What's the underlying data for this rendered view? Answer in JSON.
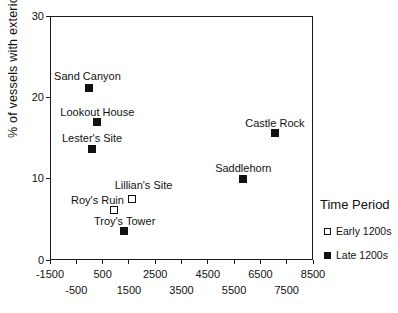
{
  "figure": {
    "background": "#ffffff",
    "marker_color": "#111111"
  },
  "chart_data": {
    "type": "scatter",
    "title": "",
    "xlabel": "",
    "ylabel": "% of vessels with exterior banded designs",
    "xlim": [
      -1500,
      8500
    ],
    "ylim": [
      0,
      30
    ],
    "grid": false,
    "x_ticks_row1": [
      -1500,
      500,
      2500,
      4500,
      6500,
      8500
    ],
    "x_ticks_row2": [
      -500,
      1500,
      3500,
      5500,
      7500
    ],
    "y_ticks": [
      0,
      10,
      20,
      30
    ],
    "legend": {
      "title": "Time Period",
      "position": "right-outside",
      "entries": [
        {
          "label": "Early 1200s",
          "marker": "open-square"
        },
        {
          "label": "Late 1200s",
          "marker": "filled-square"
        }
      ]
    },
    "series": [
      {
        "name": "Early 1200s",
        "marker": "open-square",
        "points": [
          {
            "label": "Lillian's Site",
            "x": 1600,
            "y": 7.5,
            "label_dx": 12,
            "label_dy": -14
          },
          {
            "label": "Roy's Ruin",
            "x": 950,
            "y": 6.2,
            "label_dx": -17,
            "label_dy": -10
          }
        ]
      },
      {
        "name": "Late 1200s",
        "marker": "filled-square",
        "points": [
          {
            "label": "Sand Canyon",
            "x": 0,
            "y": 21.2,
            "label_dx": -2,
            "label_dy": -12
          },
          {
            "label": "Lookout House",
            "x": 300,
            "y": 17.0,
            "label_dx": 0,
            "label_dy": -10
          },
          {
            "label": "Lester's Site",
            "x": 100,
            "y": 13.7,
            "label_dx": 0,
            "label_dy": -11
          },
          {
            "label": "Castle Rock",
            "x": 7050,
            "y": 15.6,
            "label_dx": 0,
            "label_dy": -10
          },
          {
            "label": "Saddlehorn",
            "x": 5850,
            "y": 10.0,
            "label_dx": 0,
            "label_dy": -11
          },
          {
            "label": "Troy's Tower",
            "x": 1300,
            "y": 3.6,
            "label_dx": 1,
            "label_dy": -10
          }
        ]
      }
    ]
  }
}
